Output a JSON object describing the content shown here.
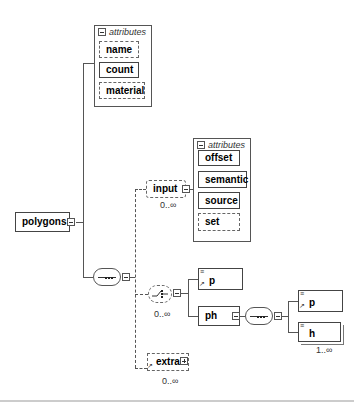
{
  "diagram": {
    "root": {
      "name": "polygons"
    },
    "root_attributes": {
      "header": "attributes",
      "items": [
        {
          "name": "name",
          "optional": true
        },
        {
          "name": "count",
          "optional": false
        },
        {
          "name": "material",
          "optional": true
        }
      ]
    },
    "sequence": {
      "type": "sequence"
    },
    "input": {
      "name": "input",
      "cardinality": "0..∞",
      "attributes": {
        "header": "attributes",
        "items": [
          {
            "name": "offset",
            "optional": false
          },
          {
            "name": "semantic",
            "optional": false
          },
          {
            "name": "source",
            "optional": false
          },
          {
            "name": "set",
            "optional": true
          }
        ]
      }
    },
    "choice": {
      "type": "choice",
      "cardinality": "0..∞",
      "children": [
        {
          "name": "p",
          "reference": true
        },
        {
          "name": "ph"
        }
      ]
    },
    "ph_sequence": {
      "type": "sequence",
      "children": [
        {
          "name": "p",
          "reference": true
        },
        {
          "name": "h",
          "cardinality": "1..∞"
        }
      ]
    },
    "extra": {
      "name": "extra",
      "cardinality": "0..∞",
      "reference": true,
      "collapsed": true
    }
  }
}
